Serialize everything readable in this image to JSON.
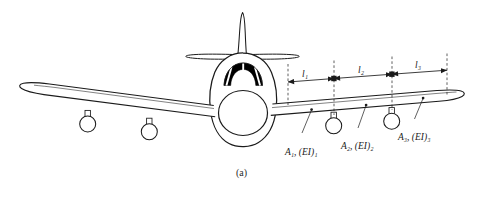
{
  "figure": {
    "caption": "(a)",
    "background_color": "#ffffff",
    "line_color": "#1b1b1b",
    "fill_color": "#ffffff",
    "canopy_color": "#000000"
  },
  "segment_labels": [
    {
      "id": "A1",
      "area": "A",
      "area_sub": "1",
      "stiffness": "(EI)",
      "stiffness_sub": "1",
      "text": "A₁, (EI)₁"
    },
    {
      "id": "A2",
      "area": "A",
      "area_sub": "2",
      "stiffness": "(EI)",
      "stiffness_sub": "2",
      "text": "A₂, (EI)₂"
    },
    {
      "id": "A3",
      "area": "A",
      "area_sub": "3",
      "stiffness": "(EI)",
      "stiffness_sub": "3",
      "text": "A₃, (EI)₃"
    }
  ],
  "dimension_labels": [
    {
      "id": "l1",
      "symbol": "l",
      "sub": "1",
      "text": "l₁"
    },
    {
      "id": "l2",
      "symbol": "l",
      "sub": "2",
      "text": "l₂"
    },
    {
      "id": "l3",
      "symbol": "l",
      "sub": "3",
      "text": "l₃"
    }
  ],
  "aircraft_parts": [
    {
      "name": "tail-fin"
    },
    {
      "name": "horizontal-stabilizer-left"
    },
    {
      "name": "horizontal-stabilizer-right"
    },
    {
      "name": "fuselage"
    },
    {
      "name": "cockpit-canopy"
    },
    {
      "name": "engine-intake"
    },
    {
      "name": "wing-left"
    },
    {
      "name": "wing-right"
    },
    {
      "name": "nacelle-left-outer"
    },
    {
      "name": "nacelle-left-inner"
    },
    {
      "name": "nacelle-right-inner"
    },
    {
      "name": "nacelle-right-outer"
    }
  ]
}
